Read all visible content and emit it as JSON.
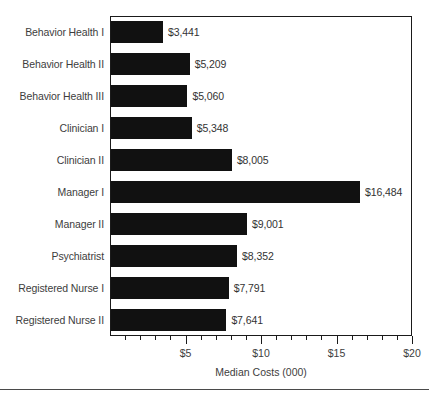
{
  "chart_data": {
    "type": "bar",
    "orientation": "horizontal",
    "title": "",
    "xlabel": "Median Costs (000)",
    "ylabel": "",
    "xlim": [
      0,
      20
    ],
    "x_tick_labels": [
      "$5",
      "$10",
      "$15",
      "$20"
    ],
    "x_tick_values": [
      5,
      10,
      15,
      20
    ],
    "x_minor_tick_step": 1,
    "grid": false,
    "legend": false,
    "bar_color": "#111111",
    "categories": [
      "Behavior Health I",
      "Behavior Health II",
      "Behavior Health III",
      "Clinician I",
      "Clinician II",
      "Manager I",
      "Manager II",
      "Psychiatrist",
      "Registered Nurse I",
      "Registered Nurse II"
    ],
    "values": [
      3441,
      5209,
      5060,
      5348,
      8005,
      16484,
      9001,
      8352,
      7791,
      7641
    ],
    "value_labels": [
      "$3,441",
      "$5,209",
      "$5,060",
      "$5,348",
      "$8,005",
      "$16,484",
      "$9,001",
      "$8,352",
      "$7,791",
      "$7,641"
    ]
  }
}
